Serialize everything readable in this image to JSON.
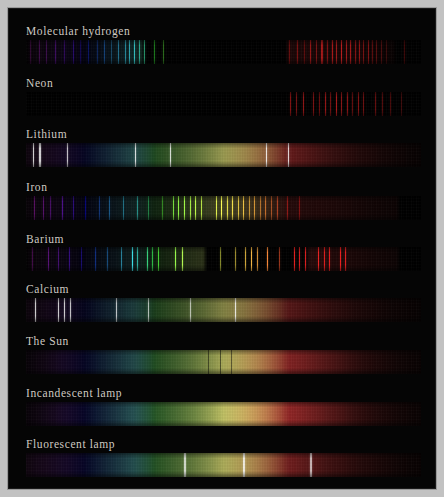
{
  "plate": {
    "title": "Emission and continuous spectra comparison plate",
    "background_color": "#c2c2c2",
    "panel_color": "#050505",
    "label_color": "#cfcac2"
  },
  "chart_data": {
    "type": "heatmap",
    "xlabel": "Wavelength (violet → red)",
    "ylabel": "Source",
    "legend": "none",
    "grid": false,
    "x": [
      380,
      780
    ],
    "categories": [
      "Molecular hydrogen",
      "Neon",
      "Lithium",
      "Iron",
      "Barium",
      "Calcium",
      "The Sun",
      "Incandescent lamp",
      "Fluorescent lamp"
    ],
    "series": [
      {
        "name": "Molecular hydrogen",
        "kind": "emission",
        "segments": [
          {
            "from": 0.5,
            "to": 30.0,
            "brightness": 0.3
          },
          {
            "from": 66.0,
            "to": 93.0,
            "brightness": 0.22
          }
        ],
        "lines": [
          {
            "x": 1.0,
            "w": 1.2,
            "i": 0.4
          },
          {
            "x": 3.2,
            "w": 0.9,
            "i": 0.46
          },
          {
            "x": 5.0,
            "w": 1.4,
            "i": 0.38
          },
          {
            "x": 7.4,
            "w": 1.0,
            "i": 0.44
          },
          {
            "x": 9.6,
            "w": 1.2,
            "i": 0.36
          },
          {
            "x": 11.8,
            "w": 0.9,
            "i": 0.42
          },
          {
            "x": 13.6,
            "w": 1.3,
            "i": 0.34
          },
          {
            "x": 15.8,
            "w": 1.0,
            "i": 0.4
          },
          {
            "x": 17.9,
            "w": 1.2,
            "i": 0.37
          },
          {
            "x": 19.8,
            "w": 0.9,
            "i": 0.44
          },
          {
            "x": 21.6,
            "w": 1.1,
            "i": 0.35
          },
          {
            "x": 23.4,
            "w": 1.0,
            "i": 0.48
          },
          {
            "x": 25.0,
            "w": 0.8,
            "i": 0.52
          },
          {
            "x": 26.2,
            "w": 0.9,
            "i": 0.58
          },
          {
            "x": 27.4,
            "w": 0.8,
            "i": 0.62
          },
          {
            "x": 28.6,
            "w": 0.7,
            "i": 0.55
          },
          {
            "x": 29.8,
            "w": 0.6,
            "i": 0.48
          },
          {
            "x": 32.5,
            "w": 0.6,
            "i": 0.4
          },
          {
            "x": 34.6,
            "w": 0.5,
            "i": 0.34
          },
          {
            "x": 66.5,
            "w": 0.7,
            "i": 0.4
          },
          {
            "x": 68.6,
            "w": 0.8,
            "i": 0.48
          },
          {
            "x": 70.4,
            "w": 0.6,
            "i": 0.36
          },
          {
            "x": 71.8,
            "w": 1.0,
            "i": 0.58
          },
          {
            "x": 73.4,
            "w": 0.7,
            "i": 0.44
          },
          {
            "x": 74.8,
            "w": 1.1,
            "i": 0.62
          },
          {
            "x": 76.2,
            "w": 0.8,
            "i": 0.5
          },
          {
            "x": 77.4,
            "w": 1.0,
            "i": 0.66
          },
          {
            "x": 78.6,
            "w": 0.9,
            "i": 0.58
          },
          {
            "x": 79.8,
            "w": 1.1,
            "i": 0.7
          },
          {
            "x": 81.0,
            "w": 0.8,
            "i": 0.6
          },
          {
            "x": 82.1,
            "w": 1.0,
            "i": 0.68
          },
          {
            "x": 83.2,
            "w": 0.9,
            "i": 0.56
          },
          {
            "x": 84.3,
            "w": 1.0,
            "i": 0.64
          },
          {
            "x": 85.4,
            "w": 0.8,
            "i": 0.52
          },
          {
            "x": 86.5,
            "w": 0.9,
            "i": 0.58
          },
          {
            "x": 87.6,
            "w": 0.7,
            "i": 0.46
          },
          {
            "x": 88.7,
            "w": 0.8,
            "i": 0.42
          },
          {
            "x": 89.9,
            "w": 0.6,
            "i": 0.38
          },
          {
            "x": 91.2,
            "w": 0.5,
            "i": 0.3
          },
          {
            "x": 95.8,
            "w": 0.7,
            "i": 0.44
          }
        ]
      },
      {
        "name": "Neon",
        "kind": "emission",
        "segments": [],
        "lines": [
          {
            "x": 66.8,
            "w": 0.8,
            "i": 0.5
          },
          {
            "x": 68.4,
            "w": 0.7,
            "i": 0.42
          },
          {
            "x": 70.0,
            "w": 0.9,
            "i": 0.54
          },
          {
            "x": 72.6,
            "w": 0.8,
            "i": 0.46
          },
          {
            "x": 74.3,
            "w": 0.7,
            "i": 0.4
          },
          {
            "x": 75.6,
            "w": 0.9,
            "i": 0.58
          },
          {
            "x": 77.0,
            "w": 0.7,
            "i": 0.44
          },
          {
            "x": 78.4,
            "w": 1.0,
            "i": 0.62
          },
          {
            "x": 79.8,
            "w": 0.8,
            "i": 0.5
          },
          {
            "x": 81.2,
            "w": 0.9,
            "i": 0.56
          },
          {
            "x": 82.6,
            "w": 0.7,
            "i": 0.42
          },
          {
            "x": 84.0,
            "w": 0.9,
            "i": 0.54
          },
          {
            "x": 85.4,
            "w": 0.8,
            "i": 0.48
          },
          {
            "x": 88.4,
            "w": 0.9,
            "i": 0.52
          },
          {
            "x": 90.0,
            "w": 0.8,
            "i": 0.46
          },
          {
            "x": 92.2,
            "w": 0.7,
            "i": 0.44
          },
          {
            "x": 95.0,
            "w": 0.8,
            "i": 0.4
          }
        ]
      },
      {
        "name": "Lithium",
        "kind": "continuum_with_lines",
        "segments": [
          {
            "from": 0,
            "to": 100,
            "brightness": 0.52
          }
        ],
        "lines": [
          {
            "x": 1.8,
            "w": 1.0,
            "i": 0.95
          },
          {
            "x": 3.4,
            "w": 1.2,
            "i": 0.98
          },
          {
            "x": 10.4,
            "w": 0.9,
            "i": 0.92
          },
          {
            "x": 27.6,
            "w": 1.3,
            "i": 1.0
          },
          {
            "x": 36.4,
            "w": 1.1,
            "i": 0.98
          },
          {
            "x": 60.8,
            "w": 1.2,
            "i": 1.0
          },
          {
            "x": 66.4,
            "w": 1.0,
            "i": 0.96
          }
        ]
      },
      {
        "name": "Iron",
        "kind": "emission_dense",
        "segments": [
          {
            "from": 0,
            "to": 94,
            "brightness": 0.3
          }
        ],
        "lines": [
          {
            "x": 2.0,
            "w": 1.2,
            "i": 0.7
          },
          {
            "x": 4.4,
            "w": 1.0,
            "i": 0.58
          },
          {
            "x": 6.2,
            "w": 0.8,
            "i": 0.5
          },
          {
            "x": 9.0,
            "w": 1.0,
            "i": 0.6
          },
          {
            "x": 12.0,
            "w": 0.8,
            "i": 0.48
          },
          {
            "x": 15.0,
            "w": 0.9,
            "i": 0.52
          },
          {
            "x": 18.4,
            "w": 0.8,
            "i": 0.46
          },
          {
            "x": 21.0,
            "w": 0.9,
            "i": 0.5
          },
          {
            "x": 24.5,
            "w": 0.8,
            "i": 0.44
          },
          {
            "x": 28.0,
            "w": 0.9,
            "i": 0.48
          },
          {
            "x": 31.0,
            "w": 0.8,
            "i": 0.42
          },
          {
            "x": 34.5,
            "w": 0.9,
            "i": 0.46
          },
          {
            "x": 37.2,
            "w": 1.1,
            "i": 0.72
          },
          {
            "x": 38.6,
            "w": 1.0,
            "i": 0.78
          },
          {
            "x": 40.0,
            "w": 1.1,
            "i": 0.82
          },
          {
            "x": 41.4,
            "w": 1.0,
            "i": 0.76
          },
          {
            "x": 42.8,
            "w": 1.0,
            "i": 0.8
          },
          {
            "x": 44.2,
            "w": 0.9,
            "i": 0.7
          },
          {
            "x": 48.0,
            "w": 1.0,
            "i": 0.74
          },
          {
            "x": 49.4,
            "w": 1.0,
            "i": 0.8
          },
          {
            "x": 50.8,
            "w": 0.9,
            "i": 0.72
          },
          {
            "x": 52.2,
            "w": 1.0,
            "i": 0.78
          },
          {
            "x": 53.6,
            "w": 0.9,
            "i": 0.7
          },
          {
            "x": 55.0,
            "w": 1.0,
            "i": 0.76
          },
          {
            "x": 56.4,
            "w": 0.9,
            "i": 0.66
          },
          {
            "x": 57.8,
            "w": 1.0,
            "i": 0.72
          },
          {
            "x": 59.2,
            "w": 0.8,
            "i": 0.62
          },
          {
            "x": 60.6,
            "w": 0.9,
            "i": 0.68
          },
          {
            "x": 62.0,
            "w": 0.8,
            "i": 0.58
          },
          {
            "x": 63.6,
            "w": 0.9,
            "i": 0.64
          },
          {
            "x": 66.0,
            "w": 0.8,
            "i": 0.56
          },
          {
            "x": 69.0,
            "w": 0.8,
            "i": 0.5
          }
        ]
      },
      {
        "name": "Barium",
        "kind": "emission_dense",
        "segments": [
          {
            "from": 0.5,
            "to": 45.0,
            "brightness": 0.26
          },
          {
            "from": 71.0,
            "to": 94.0,
            "brightness": 0.34
          }
        ],
        "lines": [
          {
            "x": 1.5,
            "w": 1.2,
            "i": 0.54
          },
          {
            "x": 5.6,
            "w": 1.0,
            "i": 0.6
          },
          {
            "x": 8.0,
            "w": 0.9,
            "i": 0.48
          },
          {
            "x": 11.0,
            "w": 1.0,
            "i": 0.52
          },
          {
            "x": 14.0,
            "w": 0.8,
            "i": 0.44
          },
          {
            "x": 17.5,
            "w": 0.9,
            "i": 0.5
          },
          {
            "x": 20.5,
            "w": 0.9,
            "i": 0.46
          },
          {
            "x": 24.0,
            "w": 0.9,
            "i": 0.52
          },
          {
            "x": 26.8,
            "w": 1.1,
            "i": 0.78
          },
          {
            "x": 28.2,
            "w": 0.8,
            "i": 0.58
          },
          {
            "x": 30.6,
            "w": 1.0,
            "i": 0.72
          },
          {
            "x": 32.0,
            "w": 0.9,
            "i": 0.64
          },
          {
            "x": 33.4,
            "w": 1.0,
            "i": 0.7
          },
          {
            "x": 37.8,
            "w": 1.2,
            "i": 0.92
          },
          {
            "x": 39.4,
            "w": 1.2,
            "i": 0.96
          },
          {
            "x": 49.0,
            "w": 0.8,
            "i": 0.42
          },
          {
            "x": 53.0,
            "w": 0.9,
            "i": 0.5
          },
          {
            "x": 55.5,
            "w": 1.0,
            "i": 0.68
          },
          {
            "x": 57.0,
            "w": 1.1,
            "i": 0.8
          },
          {
            "x": 58.4,
            "w": 1.0,
            "i": 0.72
          },
          {
            "x": 61.0,
            "w": 1.2,
            "i": 0.9
          },
          {
            "x": 64.0,
            "w": 0.9,
            "i": 0.56
          },
          {
            "x": 67.8,
            "w": 1.1,
            "i": 0.88
          },
          {
            "x": 69.2,
            "w": 1.0,
            "i": 0.84
          },
          {
            "x": 70.6,
            "w": 1.0,
            "i": 0.86
          },
          {
            "x": 74.0,
            "w": 1.1,
            "i": 0.9
          },
          {
            "x": 75.4,
            "w": 1.0,
            "i": 0.86
          },
          {
            "x": 76.8,
            "w": 1.0,
            "i": 0.88
          },
          {
            "x": 79.4,
            "w": 1.1,
            "i": 0.92
          },
          {
            "x": 80.8,
            "w": 1.0,
            "i": 0.88
          }
        ]
      },
      {
        "name": "Calcium",
        "kind": "continuum_with_lines",
        "segments": [
          {
            "from": 0,
            "to": 100,
            "brightness": 0.44
          }
        ],
        "lines": [
          {
            "x": 2.2,
            "w": 1.4,
            "i": 0.96
          },
          {
            "x": 8.0,
            "w": 1.0,
            "i": 0.94
          },
          {
            "x": 9.6,
            "w": 1.0,
            "i": 0.95
          },
          {
            "x": 11.2,
            "w": 0.9,
            "i": 0.9
          },
          {
            "x": 22.8,
            "w": 1.0,
            "i": 0.86
          },
          {
            "x": 31.0,
            "w": 0.9,
            "i": 0.8
          },
          {
            "x": 41.4,
            "w": 0.9,
            "i": 0.78
          },
          {
            "x": 52.8,
            "w": 1.4,
            "i": 1.0
          }
        ]
      },
      {
        "name": "The Sun",
        "kind": "continuum",
        "segments": [
          {
            "from": 0,
            "to": 100,
            "brightness": 0.55
          }
        ],
        "lines": [
          {
            "x": 46.0,
            "w": 0.6,
            "i": 0.25
          },
          {
            "x": 49.0,
            "w": 0.6,
            "i": 0.22
          },
          {
            "x": 52.0,
            "w": 0.5,
            "i": 0.2
          }
        ]
      },
      {
        "name": "Incandescent lamp",
        "kind": "continuum",
        "segments": [
          {
            "from": 0,
            "to": 100,
            "brightness": 0.62
          }
        ],
        "lines": []
      },
      {
        "name": "Fluorescent lamp",
        "kind": "continuum_with_lines",
        "segments": [
          {
            "from": 0,
            "to": 100,
            "brightness": 0.58
          }
        ],
        "lines": [
          {
            "x": 40.0,
            "w": 1.6,
            "i": 0.88
          },
          {
            "x": 55.0,
            "w": 2.0,
            "i": 0.95
          },
          {
            "x": 72.0,
            "w": 1.4,
            "i": 0.8
          }
        ]
      }
    ]
  },
  "rows": [
    {
      "label": "Molecular hydrogen",
      "label_y": 16,
      "band_y": 31,
      "band_left": 17,
      "band_width": 395,
      "band_height": 24
    },
    {
      "label": "Neon",
      "label_y": 68,
      "band_y": 83,
      "band_left": 17,
      "band_width": 395,
      "band_height": 24
    },
    {
      "label": "Lithium",
      "label_y": 119,
      "band_y": 134,
      "band_left": 17,
      "band_width": 395,
      "band_height": 24
    },
    {
      "label": "Iron",
      "label_y": 172,
      "band_y": 187,
      "band_left": 17,
      "band_width": 395,
      "band_height": 24
    },
    {
      "label": "Barium",
      "label_y": 224,
      "band_y": 238,
      "band_left": 17,
      "band_width": 395,
      "band_height": 24
    },
    {
      "label": "Calcium",
      "label_y": 274,
      "band_y": 289,
      "band_left": 17,
      "band_width": 395,
      "band_height": 24
    },
    {
      "label": "The Sun",
      "label_y": 326,
      "band_y": 341,
      "band_left": 17,
      "band_width": 395,
      "band_height": 24
    },
    {
      "label": "Incandescent lamp",
      "label_y": 378,
      "band_y": 393,
      "band_left": 17,
      "band_width": 395,
      "band_height": 24
    },
    {
      "label": "Fluorescent lamp",
      "label_y": 429,
      "band_y": 444,
      "band_left": 17,
      "band_width": 395,
      "band_height": 24
    }
  ]
}
